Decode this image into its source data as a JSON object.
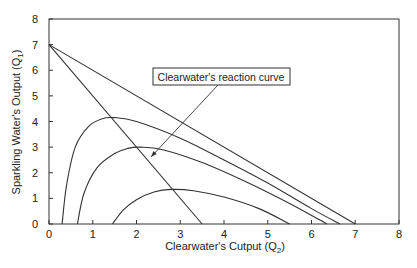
{
  "chart_data": {
    "type": "line",
    "title": "",
    "xlabel": "Clearwater's Cutput (Q",
    "xlabel_sub": "2",
    "xlabel_end": ")",
    "ylabel": "Sparkling Water's Output (Q",
    "ylabel_sub": "1",
    "ylabel_end": ")",
    "xlim": [
      0,
      8
    ],
    "ylim": [
      0,
      8
    ],
    "xticks": [
      "0",
      "1",
      "2",
      "3",
      "4",
      "5",
      "6",
      "7",
      "8"
    ],
    "yticks": [
      "0",
      "1",
      "2",
      "3",
      "4",
      "5",
      "6",
      "7",
      "8"
    ],
    "grid": false,
    "annotation": {
      "text": "Clearwater's reaction curve",
      "arrow_to": [
        2.3,
        2.6
      ]
    },
    "series": [
      {
        "name": "Clearwater's reaction curve",
        "kind": "line",
        "x": [
          0,
          3.5
        ],
        "y": [
          7,
          0
        ]
      },
      {
        "name": "Sparkling Water demand line",
        "kind": "line",
        "x": [
          0,
          7
        ],
        "y": [
          7,
          0
        ]
      },
      {
        "name": "Iso-profit curve high",
        "kind": "curve",
        "x": [
          0.3,
          0.4,
          0.6,
          0.9,
          1.2,
          1.5,
          2.0,
          3.0,
          4.0,
          5.0,
          6.0,
          6.65
        ],
        "y": [
          0,
          1.5,
          3.0,
          3.8,
          4.1,
          4.15,
          4.0,
          3.35,
          2.5,
          1.6,
          0.6,
          0
        ]
      },
      {
        "name": "Iso-profit curve middle",
        "kind": "curve",
        "x": [
          0.65,
          0.8,
          1.1,
          1.5,
          1.8,
          2.1,
          2.6,
          3.5,
          4.5,
          5.5,
          6.35
        ],
        "y": [
          0,
          1.2,
          2.2,
          2.75,
          2.95,
          3.0,
          2.9,
          2.4,
          1.65,
          0.8,
          0
        ]
      },
      {
        "name": "Iso-profit curve low",
        "kind": "curve",
        "x": [
          1.45,
          1.7,
          2.0,
          2.4,
          2.8,
          3.3,
          4.0,
          4.8,
          5.5
        ],
        "y": [
          0,
          0.55,
          0.95,
          1.25,
          1.35,
          1.3,
          1.05,
          0.6,
          0
        ]
      }
    ]
  }
}
